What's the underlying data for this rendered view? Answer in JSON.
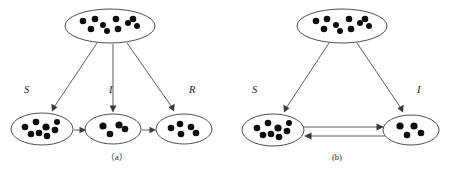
{
  "figure": {
    "type": "diagram",
    "background_color": "#ffffff",
    "dot_color": "#0d0d0d",
    "ellipse_stroke_color": "#3a3a3a",
    "arrow_color": "#4a4a4a",
    "panels": [
      {
        "id": "panel-a",
        "caption": "（a）",
        "caption_x": 117,
        "caption_y": 160,
        "model": "SIR",
        "source_node": {
          "name": "population-pool-a",
          "cx": 110,
          "cy": 26,
          "rx": 45,
          "ry": 17,
          "dot_count": 10,
          "dots": [
            {
              "x": 83,
              "y": 21,
              "r": 3.3
            },
            {
              "x": 95,
              "y": 19,
              "r": 3.3
            },
            {
              "x": 91,
              "y": 29,
              "r": 3.3
            },
            {
              "x": 103,
              "y": 25,
              "r": 3.0
            },
            {
              "x": 107,
              "y": 31,
              "r": 3.0
            },
            {
              "x": 116,
              "y": 19,
              "r": 3.3
            },
            {
              "x": 118,
              "y": 29,
              "r": 3.3
            },
            {
              "x": 128,
              "y": 23,
              "r": 3.0
            },
            {
              "x": 133,
              "y": 19,
              "r": 3.3
            },
            {
              "x": 137,
              "y": 26,
              "r": 3.0
            }
          ]
        },
        "compartments": [
          {
            "name": "compartment-s-a",
            "label": "S",
            "label_x": 24,
            "label_y": 93,
            "cx": 42,
            "cy": 129,
            "rx": 31,
            "ry": 16,
            "dot_count": 8,
            "dots": [
              {
                "x": 25,
                "y": 127,
                "r": 3.3
              },
              {
                "x": 36,
                "y": 122,
                "r": 3.3
              },
              {
                "x": 31,
                "y": 134,
                "r": 3.3
              },
              {
                "x": 39,
                "y": 133,
                "r": 3.3
              },
              {
                "x": 46,
                "y": 127,
                "r": 3.6
              },
              {
                "x": 47,
                "y": 136,
                "r": 3.3
              },
              {
                "x": 55,
                "y": 130,
                "r": 3.3
              },
              {
                "x": 57,
                "y": 122,
                "r": 3.0
              }
            ]
          },
          {
            "name": "compartment-i-a",
            "label": "I",
            "label_x": 109,
            "label_y": 93,
            "cx": 113,
            "cy": 129,
            "rx": 28,
            "ry": 15,
            "dot_count": 4,
            "dots": [
              {
                "x": 103,
                "y": 126,
                "r": 3.6
              },
              {
                "x": 110,
                "y": 134,
                "r": 3.3
              },
              {
                "x": 119,
                "y": 125,
                "r": 3.6
              },
              {
                "x": 125,
                "y": 129,
                "r": 3.3
              }
            ]
          },
          {
            "name": "compartment-r-a",
            "label": "R",
            "label_x": 189,
            "label_y": 93,
            "cx": 184,
            "cy": 129,
            "rx": 28,
            "ry": 15,
            "dot_count": 5,
            "dots": [
              {
                "x": 171,
                "y": 128,
                "r": 3.3
              },
              {
                "x": 180,
                "y": 124,
                "r": 3.3
              },
              {
                "x": 181,
                "y": 134,
                "r": 3.3
              },
              {
                "x": 191,
                "y": 127,
                "r": 3.3
              },
              {
                "x": 196,
                "y": 133,
                "r": 3.3
              }
            ]
          }
        ],
        "arrows": [
          {
            "name": "arrow-pool-to-s-a",
            "x1": 97,
            "y1": 43,
            "x2": 52,
            "y2": 110,
            "kind": "spawn"
          },
          {
            "name": "arrow-pool-to-i-a",
            "x1": 113,
            "y1": 44,
            "x2": 113,
            "y2": 111,
            "kind": "spawn"
          },
          {
            "name": "arrow-pool-to-r-a",
            "x1": 127,
            "y1": 43,
            "x2": 174,
            "y2": 110,
            "kind": "spawn"
          },
          {
            "name": "arrow-s-to-i-a",
            "x1": 74,
            "y1": 130,
            "x2": 84,
            "y2": 130,
            "kind": "transition"
          },
          {
            "name": "arrow-i-to-r-a",
            "x1": 142,
            "y1": 130,
            "x2": 155,
            "y2": 130,
            "kind": "transition"
          }
        ]
      },
      {
        "id": "panel-b",
        "caption": "(b)",
        "caption_x": 337,
        "caption_y": 160,
        "model": "SIS",
        "source_node": {
          "name": "population-pool-b",
          "cx": 342,
          "cy": 26,
          "rx": 45,
          "ry": 17,
          "dot_count": 10,
          "dots": [
            {
              "x": 316,
              "y": 21,
              "r": 3.3
            },
            {
              "x": 327,
              "y": 19,
              "r": 3.3
            },
            {
              "x": 324,
              "y": 29,
              "r": 3.3
            },
            {
              "x": 336,
              "y": 25,
              "r": 3.0
            },
            {
              "x": 340,
              "y": 31,
              "r": 3.0
            },
            {
              "x": 349,
              "y": 19,
              "r": 3.3
            },
            {
              "x": 351,
              "y": 29,
              "r": 3.3
            },
            {
              "x": 360,
              "y": 23,
              "r": 3.0
            },
            {
              "x": 365,
              "y": 19,
              "r": 3.3
            },
            {
              "x": 369,
              "y": 26,
              "r": 3.0
            }
          ]
        },
        "compartments": [
          {
            "name": "compartment-s-b",
            "label": "S",
            "label_x": 252,
            "label_y": 93,
            "cx": 273,
            "cy": 130,
            "rx": 31,
            "ry": 16,
            "dot_count": 8,
            "dots": [
              {
                "x": 257,
                "y": 128,
                "r": 3.3
              },
              {
                "x": 268,
                "y": 123,
                "r": 3.3
              },
              {
                "x": 263,
                "y": 135,
                "r": 3.3
              },
              {
                "x": 271,
                "y": 134,
                "r": 3.3
              },
              {
                "x": 278,
                "y": 128,
                "r": 3.6
              },
              {
                "x": 279,
                "y": 137,
                "r": 3.3
              },
              {
                "x": 287,
                "y": 131,
                "r": 3.3
              },
              {
                "x": 289,
                "y": 123,
                "r": 3.0
              }
            ]
          },
          {
            "name": "compartment-i-b",
            "label": "I",
            "label_x": 417,
            "label_y": 93,
            "cx": 411,
            "cy": 130,
            "rx": 28,
            "ry": 15,
            "dot_count": 4,
            "dots": [
              {
                "x": 400,
                "y": 126,
                "r": 3.6
              },
              {
                "x": 407,
                "y": 135,
                "r": 3.3
              },
              {
                "x": 414,
                "y": 126,
                "r": 3.6
              },
              {
                "x": 421,
                "y": 133,
                "r": 3.3
              }
            ]
          }
        ],
        "arrows": [
          {
            "name": "arrow-pool-to-s-b",
            "x1": 329,
            "y1": 43,
            "x2": 284,
            "y2": 111,
            "kind": "spawn"
          },
          {
            "name": "arrow-pool-to-i-b",
            "x1": 357,
            "y1": 43,
            "x2": 403,
            "y2": 111,
            "kind": "spawn"
          },
          {
            "name": "arrow-s-to-i-b",
            "x1": 305,
            "y1": 127,
            "x2": 383,
            "y2": 127,
            "kind": "transition"
          },
          {
            "name": "arrow-i-to-s-b",
            "x1": 383,
            "y1": 136,
            "x2": 305,
            "y2": 136,
            "kind": "transition-reverse"
          }
        ]
      }
    ]
  }
}
